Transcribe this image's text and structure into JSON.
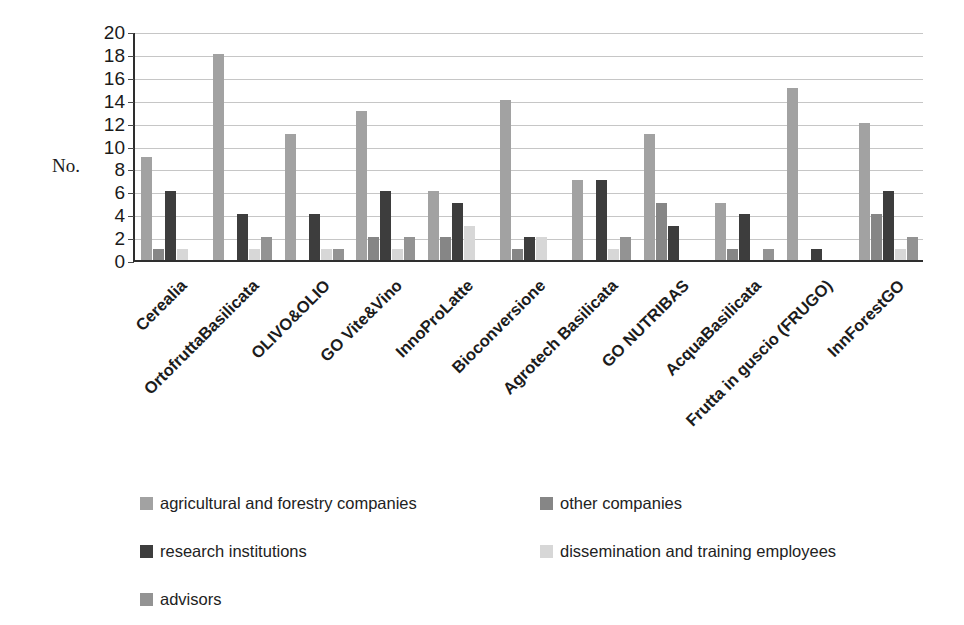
{
  "chart_data": {
    "type": "bar",
    "title": "",
    "xlabel": "",
    "ylabel": "No.",
    "ylim": [
      0,
      20
    ],
    "ytick_step": 2,
    "yticks": [
      0,
      2,
      4,
      6,
      8,
      10,
      12,
      14,
      16,
      18,
      20
    ],
    "grid": true,
    "legend_position": "bottom",
    "categories": [
      "Cerealia",
      "OrtofruttaBasilicata",
      "OLIVO&OLIO",
      "GO Vite&Vino",
      "InnoProLatte",
      "Bioconversione",
      "Agrotech Basilicata",
      "GO NUTRIBAS",
      "AcquaBasilicata",
      "Frutta in guscio (FRUGO)",
      "InnForestGO"
    ],
    "series": [
      {
        "name": "agricultural and forestry companies",
        "color": "#a2a2a2",
        "values": [
          9,
          18,
          11,
          13,
          6,
          14,
          7,
          11,
          5,
          15,
          12
        ]
      },
      {
        "name": "other companies",
        "color": "#868686",
        "values": [
          1,
          0,
          0,
          2,
          2,
          1,
          0,
          5,
          1,
          0,
          4
        ]
      },
      {
        "name": "research institutions",
        "color": "#3d3d3d",
        "values": [
          6,
          4,
          4,
          6,
          5,
          2,
          7,
          3,
          4,
          1,
          6
        ]
      },
      {
        "name": "dissemination and training employees",
        "color": "#d7d7d7",
        "values": [
          1,
          1,
          1,
          1,
          3,
          2,
          1,
          0,
          0,
          0,
          1
        ]
      },
      {
        "name": "advisors",
        "color": "#939393",
        "values": [
          0,
          2,
          1,
          2,
          0,
          0,
          2,
          0,
          1,
          0,
          2
        ]
      }
    ]
  }
}
